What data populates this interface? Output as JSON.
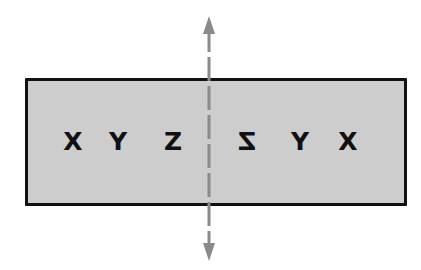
{
  "diagram": {
    "colors": {
      "box_fill": "#cdcdcd",
      "box_border": "#111111",
      "axis": "#8a8a8a",
      "text": "#111111"
    },
    "original": {
      "letters": [
        "X",
        "Y",
        "Z"
      ]
    },
    "reflection": {
      "letters": [
        "Z",
        "Y",
        "X"
      ],
      "mirrored": true
    },
    "axis": {
      "type": "dashed-line-of-symmetry",
      "arrows": [
        "up",
        "down"
      ]
    }
  }
}
